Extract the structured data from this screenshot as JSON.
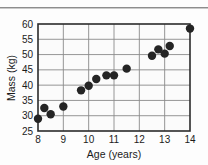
{
  "chart_data": {
    "type": "scatter",
    "title": "",
    "xlabel": "Age (years)",
    "ylabel": "Mass (kg)",
    "xlim": [
      8,
      14
    ],
    "ylim": [
      25,
      60
    ],
    "xticks": [
      8,
      9,
      10,
      11,
      12,
      13,
      14
    ],
    "yticks": [
      25,
      30,
      35,
      40,
      45,
      50,
      55,
      60
    ],
    "xtick_labels": [
      "8",
      "9",
      "10",
      "11",
      "12",
      "13",
      "14"
    ],
    "ytick_labels": [
      "25",
      "30",
      "35",
      "40",
      "45",
      "50",
      "55",
      "60"
    ],
    "grid": true,
    "grid_color": "#8a8a8a",
    "legend": null,
    "marker": "circle",
    "marker_color": "#242424",
    "marker_size": 4.2,
    "series": [
      {
        "name": "Mass vs Age",
        "points": [
          {
            "x": 8.0,
            "y": 29.0
          },
          {
            "x": 8.25,
            "y": 32.5
          },
          {
            "x": 8.5,
            "y": 30.5
          },
          {
            "x": 9.0,
            "y": 33.0
          },
          {
            "x": 9.7,
            "y": 38.3
          },
          {
            "x": 10.0,
            "y": 39.8
          },
          {
            "x": 10.3,
            "y": 42.0
          },
          {
            "x": 10.7,
            "y": 43.2
          },
          {
            "x": 11.0,
            "y": 43.2
          },
          {
            "x": 11.5,
            "y": 45.4
          },
          {
            "x": 12.5,
            "y": 49.6
          },
          {
            "x": 12.75,
            "y": 51.7
          },
          {
            "x": 13.0,
            "y": 50.3
          },
          {
            "x": 13.2,
            "y": 52.8
          },
          {
            "x": 14.0,
            "y": 58.5
          }
        ]
      }
    ]
  },
  "figure": {
    "background": "#fdfdfd",
    "axis_color": "#2b2b2b",
    "text_color": "#1b1b1b"
  }
}
